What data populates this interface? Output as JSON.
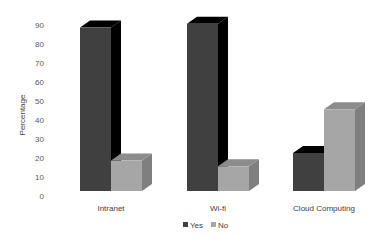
{
  "chart_data": {
    "type": "bar",
    "style": "3d-clustered-column",
    "title": "",
    "xlabel": "",
    "ylabel": "Percentage",
    "ylim": [
      0,
      90
    ],
    "yticks": [
      0,
      10,
      20,
      30,
      40,
      50,
      60,
      70,
      80,
      90
    ],
    "grid": false,
    "legend_position": "bottom",
    "categories": [
      "Intranet",
      "Wi-fi",
      "Cloud Computing"
    ],
    "series": [
      {
        "name": "Yes",
        "values": [
          86,
          88,
          20
        ],
        "color": "#404040",
        "top_color": "#000000",
        "side_color": "#000000"
      },
      {
        "name": "No",
        "values": [
          16,
          13,
          43
        ],
        "color": "#a6a6a6",
        "top_color": "#8c8c8c",
        "side_color": "#7f7f7f"
      }
    ]
  }
}
